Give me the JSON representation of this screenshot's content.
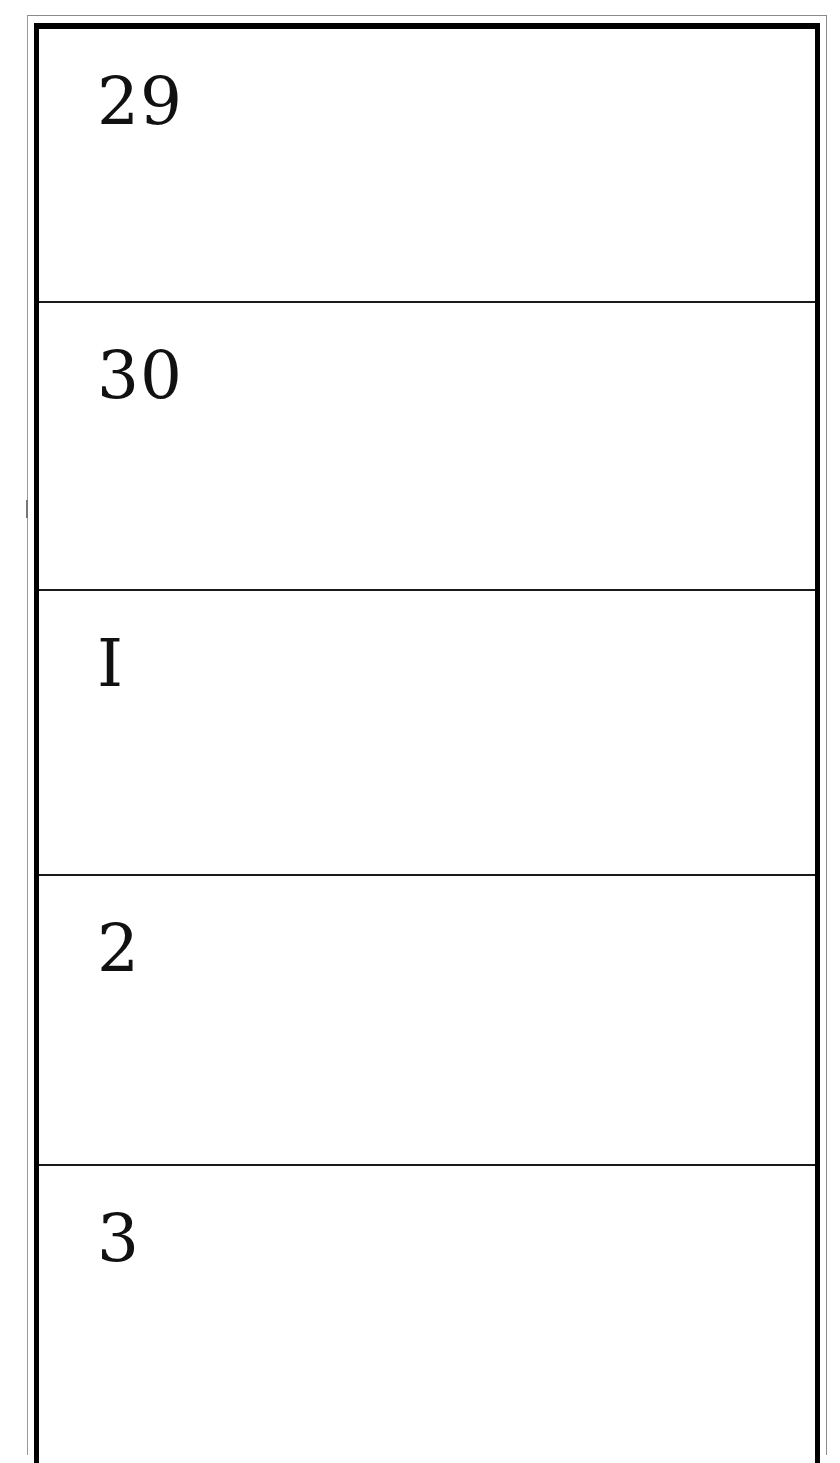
{
  "calendar": {
    "rows": [
      {
        "day": "29"
      },
      {
        "day": "30"
      },
      {
        "day": "I"
      },
      {
        "day": "2"
      },
      {
        "day": "3"
      }
    ]
  },
  "colors": {
    "frame": "#000000",
    "outer_border": "#8a8a8a",
    "divider": "#1a1a1a",
    "background": "#ffffff"
  }
}
